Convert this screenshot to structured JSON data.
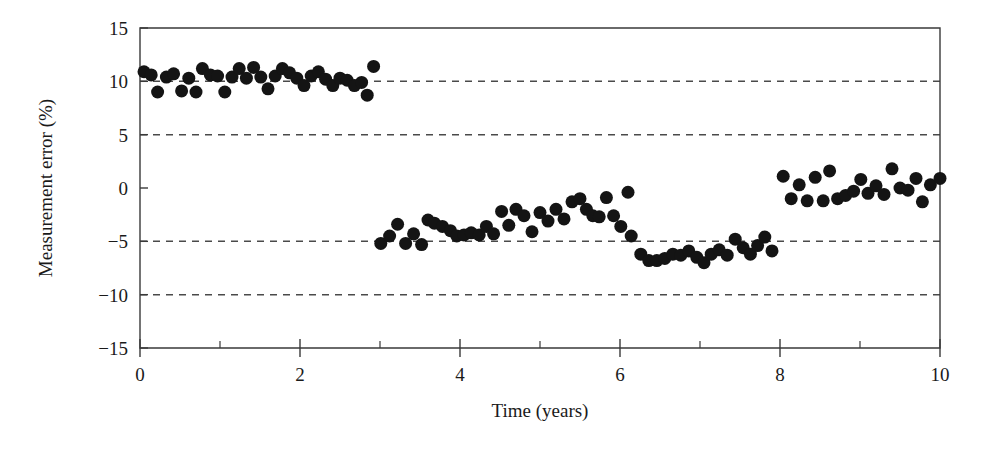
{
  "figure": {
    "title": "",
    "background_color": "#ffffff",
    "marker_color": "#141414",
    "axis_color": "#3a3a3a",
    "grid_color": "#4a4a4a"
  },
  "axes": {
    "x_title": "Time (years)",
    "y_title": "Measurement error (%)",
    "x_ticks": [
      "0",
      "2",
      "4",
      "6",
      "8",
      "10"
    ],
    "y_ticks": [
      "15",
      "10",
      "5",
      "0",
      "−5",
      "−10",
      "−15"
    ]
  },
  "chart_data": {
    "type": "scatter",
    "title": "",
    "xlabel": "Time (years)",
    "ylabel": "Measurement error (%)",
    "xlim": [
      0,
      10
    ],
    "ylim": [
      -15,
      15
    ],
    "xticks": [
      0,
      2,
      4,
      6,
      8,
      10
    ],
    "xticks_minor": [
      1,
      3,
      5,
      7,
      9
    ],
    "yticks": [
      15,
      10,
      5,
      0,
      -5,
      -10,
      -15
    ],
    "grid": false,
    "legend": "none",
    "reference_lines": {
      "orientation": "horizontal",
      "style": "dashed",
      "values": [
        10,
        5,
        -5,
        -10
      ]
    },
    "marker": {
      "shape": "circle",
      "filled": true,
      "color": "#141414",
      "size_px": 13
    },
    "series": [
      {
        "name": "Measurement error",
        "points": [
          [
            0.05,
            10.9
          ],
          [
            0.14,
            10.6
          ],
          [
            0.22,
            9.0
          ],
          [
            0.33,
            10.4
          ],
          [
            0.42,
            10.7
          ],
          [
            0.52,
            9.1
          ],
          [
            0.61,
            10.3
          ],
          [
            0.7,
            9.0
          ],
          [
            0.78,
            11.2
          ],
          [
            0.88,
            10.6
          ],
          [
            0.97,
            10.5
          ],
          [
            1.06,
            9.0
          ],
          [
            1.15,
            10.4
          ],
          [
            1.24,
            11.2
          ],
          [
            1.33,
            10.3
          ],
          [
            1.42,
            11.3
          ],
          [
            1.51,
            10.4
          ],
          [
            1.6,
            9.3
          ],
          [
            1.69,
            10.5
          ],
          [
            1.78,
            11.2
          ],
          [
            1.87,
            10.8
          ],
          [
            1.96,
            10.3
          ],
          [
            2.05,
            9.6
          ],
          [
            2.14,
            10.5
          ],
          [
            2.23,
            10.9
          ],
          [
            2.32,
            10.2
          ],
          [
            2.41,
            9.6
          ],
          [
            2.5,
            10.3
          ],
          [
            2.59,
            10.1
          ],
          [
            2.68,
            9.6
          ],
          [
            2.77,
            9.9
          ],
          [
            2.84,
            8.7
          ],
          [
            2.92,
            11.4
          ]
        ]
      },
      {
        "name": "Measurement error",
        "points": [
          [
            3.01,
            -5.2
          ],
          [
            3.12,
            -4.5
          ],
          [
            3.22,
            -3.4
          ],
          [
            3.32,
            -5.2
          ],
          [
            3.42,
            -4.3
          ],
          [
            3.52,
            -5.3
          ],
          [
            3.6,
            -3.0
          ],
          [
            3.68,
            -3.3
          ],
          [
            3.78,
            -3.6
          ],
          [
            3.88,
            -4.0
          ],
          [
            3.96,
            -4.5
          ],
          [
            4.05,
            -4.4
          ],
          [
            4.14,
            -4.2
          ],
          [
            4.24,
            -4.4
          ],
          [
            4.33,
            -3.6
          ],
          [
            4.42,
            -4.3
          ],
          [
            4.52,
            -2.2
          ],
          [
            4.61,
            -3.5
          ],
          [
            4.7,
            -2.0
          ],
          [
            4.8,
            -2.6
          ],
          [
            4.9,
            -4.1
          ],
          [
            5.0,
            -2.3
          ]
        ]
      },
      {
        "name": "Measurement error",
        "points": [
          [
            5.1,
            -3.1
          ],
          [
            5.2,
            -2.0
          ],
          [
            5.3,
            -2.9
          ],
          [
            5.4,
            -1.3
          ],
          [
            5.5,
            -1.0
          ],
          [
            5.58,
            -2.0
          ],
          [
            5.66,
            -2.6
          ],
          [
            5.74,
            -2.7
          ],
          [
            5.83,
            -0.9
          ],
          [
            5.92,
            -2.6
          ],
          [
            6.01,
            -3.6
          ],
          [
            6.1,
            -0.4
          ]
        ]
      },
      {
        "name": "Measurement error",
        "points": [
          [
            6.14,
            -4.5
          ],
          [
            6.26,
            -6.2
          ],
          [
            6.36,
            -6.8
          ],
          [
            6.46,
            -6.8
          ],
          [
            6.56,
            -6.6
          ],
          [
            6.66,
            -6.2
          ],
          [
            6.76,
            -6.3
          ],
          [
            6.86,
            -5.9
          ],
          [
            6.96,
            -6.5
          ],
          [
            7.05,
            -7.0
          ],
          [
            7.14,
            -6.2
          ],
          [
            7.24,
            -5.8
          ],
          [
            7.34,
            -6.3
          ],
          [
            7.44,
            -4.8
          ],
          [
            7.54,
            -5.6
          ],
          [
            7.63,
            -6.2
          ],
          [
            7.72,
            -5.4
          ],
          [
            7.81,
            -4.6
          ],
          [
            7.9,
            -5.9
          ]
        ]
      },
      {
        "name": "Measurement error",
        "points": [
          [
            8.04,
            1.1
          ],
          [
            8.14,
            -1.0
          ],
          [
            8.24,
            0.3
          ],
          [
            8.34,
            -1.2
          ],
          [
            8.44,
            1.0
          ],
          [
            8.54,
            -1.2
          ],
          [
            8.62,
            1.6
          ],
          [
            8.72,
            -1.0
          ],
          [
            8.82,
            -0.7
          ],
          [
            8.92,
            -0.3
          ],
          [
            9.01,
            0.8
          ],
          [
            9.1,
            -0.5
          ],
          [
            9.2,
            0.2
          ],
          [
            9.3,
            -0.6
          ],
          [
            9.4,
            1.8
          ],
          [
            9.5,
            0.0
          ],
          [
            9.6,
            -0.2
          ],
          [
            9.7,
            0.9
          ],
          [
            9.78,
            -1.3
          ],
          [
            9.88,
            0.3
          ],
          [
            10.0,
            0.9
          ]
        ]
      }
    ]
  }
}
